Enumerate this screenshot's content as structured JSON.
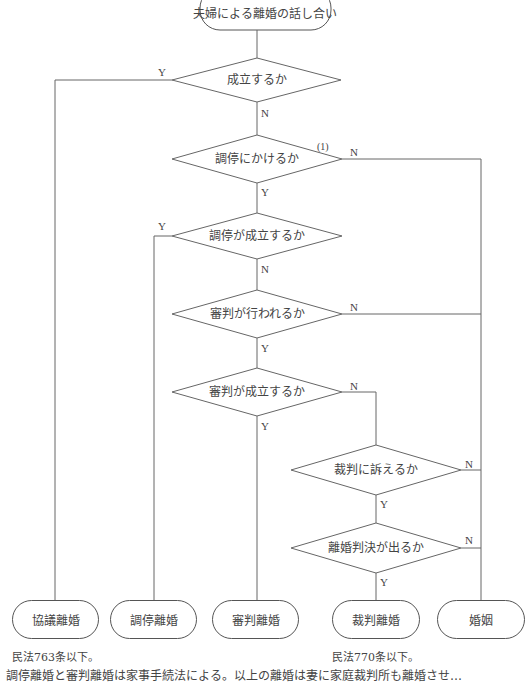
{
  "start": {
    "label": "夫婦による離婚の話し合い"
  },
  "decisions": [
    {
      "id": "d1",
      "label": "成立するか",
      "yes": "Y",
      "no": "N"
    },
    {
      "id": "d2",
      "label": "調停にかけるか",
      "yes": "Y",
      "no": "N",
      "annotation": "(1)"
    },
    {
      "id": "d3",
      "label": "調停が成立するか",
      "yes": "Y",
      "no": "N"
    },
    {
      "id": "d4",
      "label": "審判が行われるか",
      "yes": "Y",
      "no": "N"
    },
    {
      "id": "d5",
      "label": "審判が成立するか",
      "yes": "Y",
      "no": "N"
    },
    {
      "id": "d6",
      "label": "裁判に訴えるか",
      "yes": "Y",
      "no": "N"
    },
    {
      "id": "d7",
      "label": "離婚判決が出るか",
      "yes": "Y",
      "no": "N"
    }
  ],
  "outcomes": [
    {
      "label": "協議離婚"
    },
    {
      "label": "調停離婚"
    },
    {
      "label": "審判離婚"
    },
    {
      "label": "裁判離婚"
    },
    {
      "label": "婚姻"
    }
  ],
  "notes": {
    "kyogi": "民法763条以下。",
    "saiban": "民法770条以下。"
  },
  "footer": "調停離婚と審判離婚は家事手続法による。以上の離婚は妻に家庭裁判所も離婚させ…"
}
